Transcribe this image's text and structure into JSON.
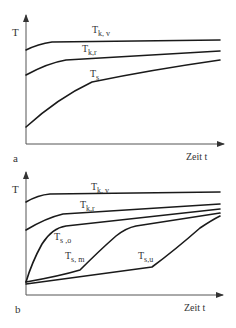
{
  "panels": [
    {
      "id": "a",
      "panel_label": "a",
      "y_axis_label": "T",
      "x_axis_label": "Zeit t",
      "curves": [
        {
          "name": "T_k,v",
          "label_main": "T",
          "label_sub": "k, v"
        },
        {
          "name": "T_k,r",
          "label_main": "T",
          "label_sub": "k,r"
        },
        {
          "name": "T_s",
          "label_main": "T",
          "label_sub": "s"
        }
      ]
    },
    {
      "id": "b",
      "panel_label": "b",
      "y_axis_label": "T",
      "x_axis_label": "Zeit t",
      "curves": [
        {
          "name": "T_k,v",
          "label_main": "T",
          "label_sub": "k, v"
        },
        {
          "name": "T_k,r",
          "label_main": "T",
          "label_sub": "k,r"
        },
        {
          "name": "T_s,o",
          "label_main": "T",
          "label_sub": "s ,o"
        },
        {
          "name": "T_s,m",
          "label_main": "T",
          "label_sub": "s, m"
        },
        {
          "name": "T_s,u",
          "label_main": "T",
          "label_sub": "s,u"
        }
      ]
    }
  ],
  "colors": {
    "curve": "#1a1a1a",
    "axis": "#555555",
    "text": "#333333",
    "background": "#ffffff"
  }
}
